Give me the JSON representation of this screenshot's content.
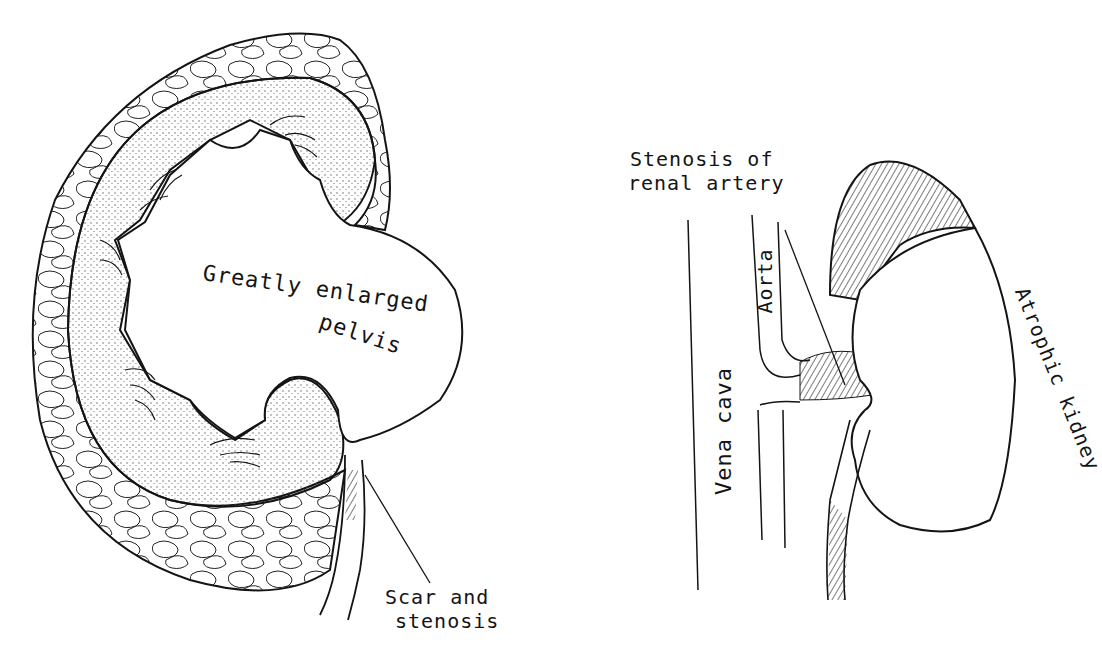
{
  "figure": {
    "left_panel": {
      "subject": "hydronephrotic kidney",
      "labels": {
        "pelvis_line1": "Greatly enlarged",
        "pelvis_line2": "pelvis",
        "scar_line1": "Scar and",
        "scar_line2": "stenosis"
      }
    },
    "right_panel": {
      "subject": "atrophic kidney with renal artery stenosis",
      "labels": {
        "stenosis_line1": "Stenosis of",
        "stenosis_line2": "renal artery",
        "aorta": "Aorta",
        "vena_cava": "Vena cava",
        "atrophic_kidney": "Atrophic kidney"
      }
    },
    "colors": {
      "ink": "#141414",
      "background": "#ffffff",
      "stipple": "#555555"
    }
  }
}
